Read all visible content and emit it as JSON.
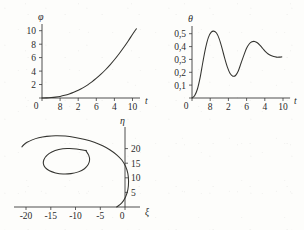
{
  "chart_data": [
    {
      "id": "phi-vs-t",
      "type": "line",
      "title": "",
      "xlabel": "t",
      "ylabel": "φ",
      "xlim": [
        0,
        10.8
      ],
      "ylim": [
        0,
        11
      ],
      "grid": false,
      "legend": null,
      "xticks": [
        0,
        2,
        4,
        6,
        8,
        10
      ],
      "xticklabels": [
        "0",
        "8",
        "2",
        "6",
        "4",
        "10"
      ],
      "yticks": [
        0,
        2,
        4,
        6,
        8,
        10
      ],
      "yticklabels": [
        "0",
        "2",
        "4",
        "6",
        "8",
        "10"
      ],
      "series": [
        {
          "name": "φ(t)",
          "x": [
            0,
            0.5,
            1,
            1.5,
            2,
            2.5,
            3,
            3.5,
            4,
            4.5,
            5,
            5.5,
            6,
            6.5,
            7,
            7.5,
            8,
            8.5,
            9,
            9.5,
            10,
            10.4
          ],
          "y": [
            0.0,
            0.02,
            0.06,
            0.13,
            0.24,
            0.4,
            0.6,
            0.85,
            1.15,
            1.5,
            1.92,
            2.4,
            2.94,
            3.54,
            4.2,
            4.93,
            5.72,
            6.58,
            7.5,
            8.48,
            9.52,
            10.3
          ]
        }
      ]
    },
    {
      "id": "theta-vs-t",
      "type": "line",
      "title": "",
      "xlabel": "t",
      "ylabel": "θ",
      "xlim": [
        0,
        10.8
      ],
      "ylim": [
        0,
        0.56
      ],
      "grid": false,
      "legend": null,
      "xticks": [
        0,
        2,
        4,
        6,
        8,
        10
      ],
      "xticklabels": [
        "0",
        "8",
        "2",
        "6",
        "4",
        "10"
      ],
      "yticks": [
        0,
        0.1,
        0.2,
        0.3,
        0.4,
        0.5
      ],
      "yticklabels": [
        "0",
        "0,1",
        "0,2",
        "0,3",
        "0,4",
        "0,5"
      ],
      "series": [
        {
          "name": "θ(t)",
          "x": [
            0,
            0.3,
            0.6,
            0.9,
            1.2,
            1.5,
            1.8,
            2.1,
            2.4,
            2.7,
            3.0,
            3.3,
            3.6,
            3.9,
            4.2,
            4.5,
            4.8,
            5.1,
            5.4,
            5.7,
            6.0,
            6.3,
            6.6,
            6.9,
            7.2,
            7.5,
            7.8,
            8.1,
            8.4,
            8.7,
            9.0,
            9.3,
            9.6,
            9.9
          ],
          "y": [
            0.0,
            0.02,
            0.07,
            0.16,
            0.28,
            0.39,
            0.47,
            0.51,
            0.52,
            0.505,
            0.46,
            0.39,
            0.31,
            0.24,
            0.19,
            0.17,
            0.175,
            0.21,
            0.27,
            0.33,
            0.385,
            0.42,
            0.437,
            0.44,
            0.43,
            0.41,
            0.385,
            0.36,
            0.342,
            0.33,
            0.322,
            0.318,
            0.318,
            0.32
          ]
        }
      ]
    },
    {
      "id": "eta-vs-xi",
      "type": "line",
      "title": "",
      "xlabel": "ξ",
      "ylabel": "η",
      "xlim": [
        -22,
        5
      ],
      "ylim": [
        0,
        23
      ],
      "grid": false,
      "legend": null,
      "xticks": [
        -20,
        -15,
        -10,
        -5,
        0
      ],
      "xticklabels": [
        "-20",
        "-15",
        "-10",
        "-5",
        "0"
      ],
      "yticks": [
        5,
        10,
        15,
        20
      ],
      "yticklabels": [
        "5",
        "10",
        "15",
        "20"
      ],
      "series": [
        {
          "name": "trajectory",
          "x": [
            0.0,
            1.1,
            1.9,
            2.4,
            2.55,
            2.4,
            1.9,
            1.1,
            0.0,
            -1.4,
            -3.0,
            -4.8,
            -6.8,
            -8.9,
            -11.0,
            -13.1,
            -15.0,
            -16.7,
            -18.1,
            -19.2,
            -19.9,
            -20.3
          ],
          "y": [
            0.0,
            1.2,
            2.9,
            5.0,
            7.3,
            9.6,
            11.7,
            13.5,
            15.0,
            16.4,
            17.6,
            18.6,
            19.4,
            20.0,
            20.4,
            20.5,
            20.3,
            19.9,
            19.3,
            18.6,
            17.9,
            17.3
          ]
        },
        {
          "name": "inner-loop",
          "x": [
            -6.6,
            -8.6,
            -10.6,
            -12.4,
            -13.9,
            -15.0,
            -15.6,
            -15.7,
            -15.3,
            -14.4,
            -13.1,
            -11.5,
            -9.8,
            -8.2,
            -6.9,
            -6.1,
            -5.8,
            -6.0,
            -6.6
          ],
          "y": [
            16.2,
            16.7,
            16.8,
            16.5,
            15.8,
            14.8,
            13.6,
            12.4,
            11.3,
            10.4,
            9.8,
            9.5,
            9.6,
            10.1,
            11.0,
            12.2,
            13.5,
            14.9,
            16.2
          ]
        }
      ]
    }
  ]
}
